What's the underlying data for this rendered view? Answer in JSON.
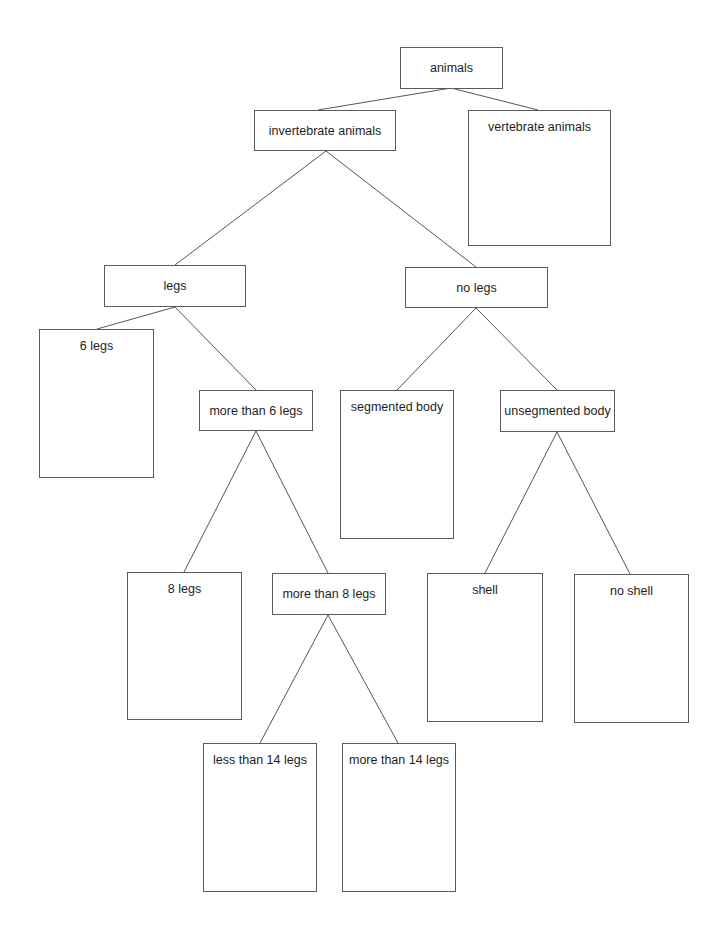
{
  "diagram": {
    "type": "dichotomous-key-tree",
    "nodes": [
      {
        "id": "animals",
        "label": "animals",
        "x": 400,
        "y": 47,
        "w": 103,
        "h": 42,
        "kind": "small"
      },
      {
        "id": "invertebrate",
        "label": "invertebrate animals",
        "x": 254,
        "y": 110,
        "w": 142,
        "h": 41,
        "kind": "small"
      },
      {
        "id": "vertebrate",
        "label": "vertebrate animals",
        "x": 468,
        "y": 110,
        "w": 143,
        "h": 136,
        "kind": "tall"
      },
      {
        "id": "legs",
        "label": "legs",
        "x": 104,
        "y": 265,
        "w": 142,
        "h": 42,
        "kind": "small"
      },
      {
        "id": "no-legs",
        "label": "no legs",
        "x": 405,
        "y": 267,
        "w": 143,
        "h": 41,
        "kind": "small"
      },
      {
        "id": "six-legs",
        "label": "6 legs",
        "x": 39,
        "y": 329,
        "w": 115,
        "h": 149,
        "kind": "tall"
      },
      {
        "id": "more-than-6",
        "label": "more than 6 legs",
        "x": 199,
        "y": 390,
        "w": 114,
        "h": 41,
        "kind": "small"
      },
      {
        "id": "segmented",
        "label": "segmented body",
        "x": 340,
        "y": 390,
        "w": 114,
        "h": 149,
        "kind": "tall"
      },
      {
        "id": "unsegmented",
        "label": "unsegmented body",
        "x": 500,
        "y": 390,
        "w": 115,
        "h": 42,
        "kind": "small"
      },
      {
        "id": "eight-legs",
        "label": "8 legs",
        "x": 127,
        "y": 572,
        "w": 115,
        "h": 148,
        "kind": "tall"
      },
      {
        "id": "more-than-8",
        "label": "more than 8 legs",
        "x": 272,
        "y": 573,
        "w": 114,
        "h": 42,
        "kind": "small"
      },
      {
        "id": "shell",
        "label": "shell",
        "x": 427,
        "y": 573,
        "w": 116,
        "h": 149,
        "kind": "tall"
      },
      {
        "id": "no-shell",
        "label": "no shell",
        "x": 574,
        "y": 574,
        "w": 115,
        "h": 149,
        "kind": "tall"
      },
      {
        "id": "less-than-14",
        "label": "less than 14 legs",
        "x": 203,
        "y": 743,
        "w": 114,
        "h": 149,
        "kind": "tall"
      },
      {
        "id": "more-than-14",
        "label": "more than 14 legs",
        "x": 342,
        "y": 743,
        "w": 114,
        "h": 149,
        "kind": "tall"
      }
    ],
    "edges": [
      {
        "from": "animals",
        "to": "invertebrate",
        "x1": 451,
        "y1": 88,
        "x2": 318,
        "y2": 110
      },
      {
        "from": "animals",
        "to": "vertebrate",
        "x1": 451,
        "y1": 88,
        "x2": 538,
        "y2": 110
      },
      {
        "from": "invertebrate",
        "to": "legs",
        "x1": 326,
        "y1": 151,
        "x2": 175,
        "y2": 265
      },
      {
        "from": "invertebrate",
        "to": "no-legs",
        "x1": 326,
        "y1": 151,
        "x2": 476,
        "y2": 267
      },
      {
        "from": "legs",
        "to": "six-legs",
        "x1": 175,
        "y1": 307,
        "x2": 97,
        "y2": 329
      },
      {
        "from": "legs",
        "to": "more-than-6",
        "x1": 175,
        "y1": 307,
        "x2": 256,
        "y2": 390
      },
      {
        "from": "no-legs",
        "to": "segmented",
        "x1": 476,
        "y1": 308,
        "x2": 397,
        "y2": 390
      },
      {
        "from": "no-legs",
        "to": "unsegmented",
        "x1": 476,
        "y1": 308,
        "x2": 557,
        "y2": 390
      },
      {
        "from": "more-than-6",
        "to": "eight-legs",
        "x1": 256,
        "y1": 431,
        "x2": 184,
        "y2": 572
      },
      {
        "from": "more-than-6",
        "to": "more-than-8",
        "x1": 256,
        "y1": 431,
        "x2": 328,
        "y2": 573
      },
      {
        "from": "unsegmented",
        "to": "shell",
        "x1": 557,
        "y1": 432,
        "x2": 485,
        "y2": 573
      },
      {
        "from": "unsegmented",
        "to": "no-shell",
        "x1": 557,
        "y1": 432,
        "x2": 630,
        "y2": 574
      },
      {
        "from": "more-than-8",
        "to": "less-than-14",
        "x1": 328,
        "y1": 615,
        "x2": 260,
        "y2": 743
      },
      {
        "from": "more-than-8",
        "to": "more-than-14",
        "x1": 328,
        "y1": 615,
        "x2": 398,
        "y2": 743
      }
    ]
  }
}
